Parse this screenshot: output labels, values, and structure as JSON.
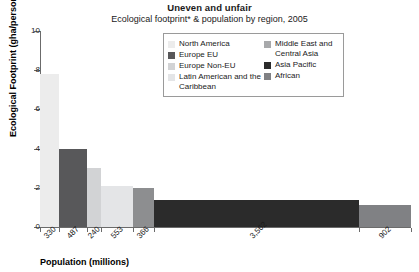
{
  "chart_data": {
    "type": "bar",
    "title": "Uneven and unfair",
    "subtitle": "Ecological footprint* & population by region, 2005",
    "xlabel": "Population (millions)",
    "ylabel": "Ecological Footprint (gha/person)",
    "ylim": [
      0,
      10
    ],
    "y_ticks": [
      0,
      2,
      4,
      6,
      8,
      10
    ],
    "y_tick_labels": [
      "0",
      "2",
      "4",
      "6",
      "8",
      "10"
    ],
    "grid": false,
    "legend_position": "upper-center-inside",
    "note": "Bar widths are proportional to population (millions); bar heights are ecological footprint in gha/person.",
    "categories": [
      "North America",
      "Europe EU",
      "Europe Non-EU",
      "Latin American and the Caribbean",
      "Middle East and Central Asia",
      "Asia Pacific",
      "African"
    ],
    "values": [
      7.8,
      4.0,
      3.0,
      2.1,
      2.0,
      1.4,
      1.1
    ],
    "widths": [
      330,
      487,
      240,
      553,
      366,
      3562,
      902
    ],
    "x_tick_labels": [
      "330",
      "487",
      "240",
      "553",
      "366",
      "3,562",
      "902"
    ],
    "colors": [
      "#ececec",
      "#58585a",
      "#d2d3d5",
      "#e4e5e7",
      "#8d8e90",
      "#2b2b2b",
      "#808184"
    ]
  },
  "legend": {
    "left_column": [
      {
        "label": "North America",
        "color": "#ececec"
      },
      {
        "label": "Europe EU",
        "color": "#58585a"
      },
      {
        "label": "Europe Non-EU",
        "color": "#d2d3d5"
      },
      {
        "label": "Latin American and the Caribbean",
        "color": "#e4e5e7"
      }
    ],
    "right_column": [
      {
        "label": "Middle East and Central Asia",
        "color": "#a8a9ab"
      },
      {
        "label": "Asia Pacific",
        "color": "#2b2b2b"
      },
      {
        "label": "African",
        "color": "#808184"
      }
    ]
  }
}
